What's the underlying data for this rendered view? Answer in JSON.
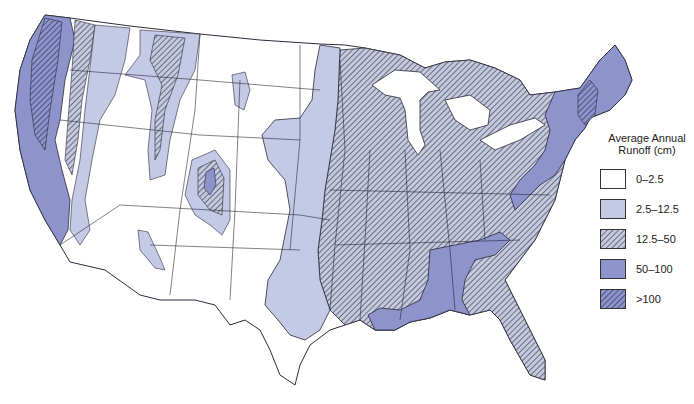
{
  "map": {
    "subject": "Average annual runoff, conterminous United States",
    "legend": {
      "title_line1": "Average Annual",
      "title_line2": "Runoff (cm)",
      "items": [
        {
          "label": "0–2.5",
          "fill": "#ffffff",
          "hatched": false
        },
        {
          "label": "2.5–12.5",
          "fill": "#c4c9e6",
          "hatched": false
        },
        {
          "label": "12.5–50",
          "fill": "#c6c8dc",
          "hatched": true
        },
        {
          "label": "50–100",
          "fill": "#8d93cb",
          "hatched": false
        },
        {
          "label": ">100",
          "fill": "#8d93cb",
          "hatched": true
        }
      ]
    },
    "colors": {
      "outline": "#2a2a3a",
      "hatch": "#3a3d5c",
      "light": "#c4c9e6",
      "medium": "#8d93cb",
      "background": "#ffffff"
    }
  }
}
